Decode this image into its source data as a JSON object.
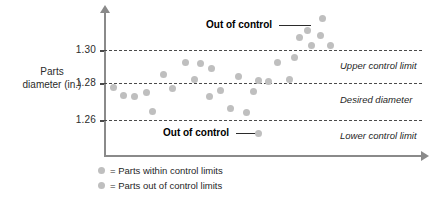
{
  "axis": {
    "y_title_line1": "Parts",
    "y_title_line2": "diameter (in.)",
    "ticks": [
      "1.30",
      "1.28",
      "1.26"
    ]
  },
  "annotations": {
    "upper_limit": "Upper control limit",
    "desired": "Desired diameter",
    "lower_limit": "Lower control limit",
    "out_of_control_top": "Out of control",
    "out_of_control_bottom": "Out of control"
  },
  "legend": {
    "within": "= Parts within control limits",
    "outside": "= Parts out of control limits"
  },
  "colors": {
    "point": "#bfbfbf",
    "axis": "#8a8a8a",
    "limit_line": "#4a4a4a",
    "text": "#1f1f1f"
  },
  "chart_data": {
    "type": "scatter",
    "title": "",
    "xlabel": "",
    "ylabel": "Parts diameter (in.)",
    "ylim": [
      1.24,
      1.325
    ],
    "yticks": [
      1.26,
      1.28,
      1.3
    ],
    "grid": false,
    "legend_position": "below-axis",
    "control_limits": {
      "upper_control_limit": 1.3,
      "desired_diameter": 1.28,
      "lower_control_limit": 1.26
    },
    "series": [
      {
        "name": "Parts within control limits",
        "points": [
          {
            "x": 1,
            "y": 1.277
          },
          {
            "x": 2,
            "y": 1.2725
          },
          {
            "x": 3,
            "y": 1.2722
          },
          {
            "x": 4,
            "y": 1.2745
          },
          {
            "x": 5,
            "y": 1.263
          },
          {
            "x": 6,
            "y": 1.286
          },
          {
            "x": 7,
            "y": 1.2765
          },
          {
            "x": 8,
            "y": 1.2925
          },
          {
            "x": 9,
            "y": 1.2835
          },
          {
            "x": 10,
            "y": 1.292
          },
          {
            "x": 11,
            "y": 1.289
          },
          {
            "x": 12,
            "y": 1.2735
          },
          {
            "x": 13,
            "y": 1.276
          },
          {
            "x": 14,
            "y": 1.2645
          },
          {
            "x": 15,
            "y": 1.2855
          },
          {
            "x": 16,
            "y": 1.262
          },
          {
            "x": 17,
            "y": 1.275
          },
          {
            "x": 18,
            "y": 1.283
          },
          {
            "x": 19,
            "y": 1.2825
          },
          {
            "x": 20,
            "y": 1.293
          },
          {
            "x": 21,
            "y": 1.2835
          },
          {
            "x": 22,
            "y": 1.296
          }
        ]
      },
      {
        "name": "Parts out of control limits",
        "points": [
          {
            "x": 23,
            "y": 1.3075
          },
          {
            "x": 24,
            "y": 1.3115
          },
          {
            "x": 25,
            "y": 1.3035
          },
          {
            "x": 26,
            "y": 1.3185
          },
          {
            "x": 27,
            "y": 1.3095
          },
          {
            "x": 28,
            "y": 1.303
          },
          {
            "x": 14.5,
            "y": 1.2455
          }
        ]
      }
    ]
  },
  "points_px": [
    {
      "x": 113,
      "y": 87,
      "group": "within"
    },
    {
      "x": 123,
      "y": 95,
      "group": "within"
    },
    {
      "x": 134,
      "y": 96,
      "group": "within"
    },
    {
      "x": 146,
      "y": 92,
      "group": "within"
    },
    {
      "x": 152,
      "y": 111,
      "group": "within"
    },
    {
      "x": 163,
      "y": 74,
      "group": "within"
    },
    {
      "x": 172,
      "y": 88,
      "group": "within"
    },
    {
      "x": 185,
      "y": 62,
      "group": "within"
    },
    {
      "x": 194,
      "y": 79,
      "group": "within"
    },
    {
      "x": 200,
      "y": 63,
      "group": "within"
    },
    {
      "x": 211,
      "y": 68,
      "group": "within"
    },
    {
      "x": 209,
      "y": 96,
      "group": "within"
    },
    {
      "x": 220,
      "y": 90,
      "group": "within"
    },
    {
      "x": 230,
      "y": 108,
      "group": "within"
    },
    {
      "x": 238,
      "y": 76,
      "group": "within"
    },
    {
      "x": 246,
      "y": 112,
      "group": "within"
    },
    {
      "x": 253,
      "y": 91,
      "group": "within"
    },
    {
      "x": 258,
      "y": 80,
      "group": "within"
    },
    {
      "x": 268,
      "y": 81,
      "group": "within"
    },
    {
      "x": 277,
      "y": 62,
      "group": "within"
    },
    {
      "x": 289,
      "y": 79,
      "group": "within"
    },
    {
      "x": 294,
      "y": 57,
      "group": "within"
    },
    {
      "x": 299,
      "y": 37,
      "group": "out"
    },
    {
      "x": 307,
      "y": 30,
      "group": "out"
    },
    {
      "x": 311,
      "y": 45,
      "group": "out"
    },
    {
      "x": 322,
      "y": 18,
      "group": "out"
    },
    {
      "x": 320,
      "y": 35,
      "group": "out"
    },
    {
      "x": 330,
      "y": 45,
      "group": "out"
    },
    {
      "x": 258,
      "y": 133,
      "group": "out"
    }
  ]
}
